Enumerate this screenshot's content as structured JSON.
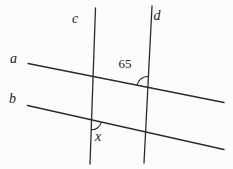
{
  "diagram": {
    "kind": "geometry-angles-parallel-lines-with-transversals",
    "background_color": "#fcfcfc",
    "line_color": "#2b2b2b",
    "labels": {
      "line_a": "a",
      "line_b": "b",
      "transversal_c": "c",
      "transversal_d": "d",
      "angle_at_a_d": "65",
      "angle_at_b_c": "x"
    }
  }
}
